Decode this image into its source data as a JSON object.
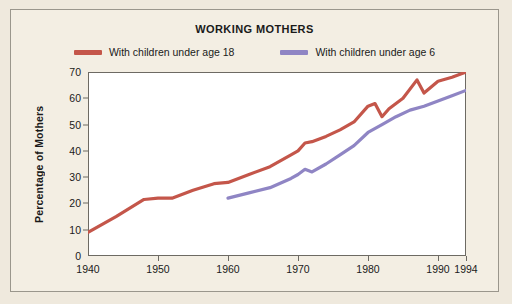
{
  "figure": {
    "title": "WORKING MOTHERS",
    "background_color": "#f3eee3",
    "border_color": "#9a968c"
  },
  "legend": [
    {
      "label": "With children under age 18",
      "color": "#c4564a",
      "name": "legend-under-18"
    },
    {
      "label": "With children under age 6",
      "color": "#8f85c4",
      "name": "legend-under-6"
    }
  ],
  "axes": {
    "ylabel": "Percentage of Mothers",
    "yticks": [
      "0",
      "10",
      "20",
      "30",
      "40",
      "50",
      "60",
      "70"
    ],
    "xticks": [
      "1940",
      "1950",
      "1960",
      "1970",
      "1980",
      "1990",
      "1994"
    ]
  },
  "chart_data": {
    "type": "line",
    "title": "WORKING MOTHERS",
    "xlabel": "",
    "ylabel": "Percentage of Mothers",
    "xlim": [
      1940,
      1994
    ],
    "ylim": [
      0,
      70
    ],
    "grid": false,
    "legend_position": "top",
    "xticks": [
      1940,
      1950,
      1960,
      1970,
      1980,
      1990,
      1994
    ],
    "yticks": [
      0,
      10,
      20,
      30,
      40,
      50,
      60,
      70
    ],
    "series": [
      {
        "name": "With children under age 18",
        "color": "#c4564a",
        "x": [
          1940,
          1944,
          1948,
          1950,
          1952,
          1955,
          1958,
          1960,
          1963,
          1966,
          1969,
          1970,
          1971,
          1972,
          1974,
          1976,
          1978,
          1980,
          1981,
          1982,
          1983,
          1985,
          1987,
          1988,
          1990,
          1992,
          1994
        ],
        "y": [
          9,
          15,
          21.5,
          22,
          22,
          25,
          27.5,
          28,
          31,
          34,
          38.5,
          40,
          43,
          43.5,
          45.5,
          48,
          51,
          57,
          58,
          53,
          56,
          60,
          67,
          62,
          66.5,
          68,
          70
        ]
      },
      {
        "name": "With children under age 6",
        "color": "#8f85c4",
        "x": [
          1960,
          1963,
          1966,
          1969,
          1970,
          1971,
          1972,
          1974,
          1976,
          1978,
          1980,
          1982,
          1984,
          1986,
          1988,
          1990,
          1992,
          1994
        ],
        "y": [
          22,
          24,
          26,
          29.5,
          31,
          33,
          32,
          35,
          38.5,
          42,
          47,
          50,
          53,
          55.5,
          57,
          59,
          61,
          63
        ]
      }
    ]
  }
}
